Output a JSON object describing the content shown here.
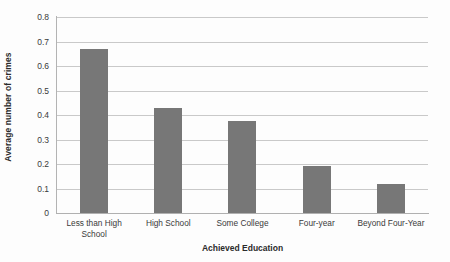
{
  "chart_data": {
    "type": "bar",
    "title": "",
    "categories": [
      "Less than High School",
      "High School",
      "Some College",
      "Four-year",
      "Beyond Four-Year"
    ],
    "values": [
      0.67,
      0.43,
      0.375,
      0.19,
      0.12
    ],
    "series": [
      {
        "name": "Average number of crimes",
        "values": [
          0.67,
          0.43,
          0.375,
          0.19,
          0.12
        ]
      }
    ],
    "xlabel": "Achieved Education",
    "ylabel": "Average number of crimes",
    "ylim": [
      0,
      0.8
    ],
    "ytick_labels": [
      "0.8",
      "0.7",
      "0.6",
      "0.5",
      "0.4",
      "0.3",
      "0.2",
      "0.1",
      "0"
    ],
    "ytick_values": [
      0.8,
      0.7,
      0.6,
      0.5,
      0.4,
      0.3,
      0.2,
      0.1,
      0
    ],
    "grid": "horizontal",
    "legend": "none",
    "bar_color": "#777777",
    "gridline_color": "#c9c9c9",
    "axis_color": "#b0b0b0",
    "text_color": "#3a3a3a"
  }
}
